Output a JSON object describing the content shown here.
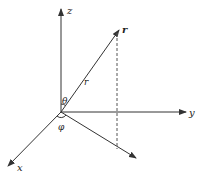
{
  "diagram": {
    "type": "spherical-coordinates",
    "colors": {
      "stroke": "#333333",
      "text": "#222222",
      "background": "#ffffff"
    },
    "axes": {
      "z": {
        "label": "z"
      },
      "y": {
        "label": "y"
      },
      "x": {
        "label": "x"
      }
    },
    "vector": {
      "tip_label": "r",
      "length_label": "r"
    },
    "angles": {
      "polar": {
        "label": "θ"
      },
      "azimuthal": {
        "label": "φ"
      }
    }
  }
}
